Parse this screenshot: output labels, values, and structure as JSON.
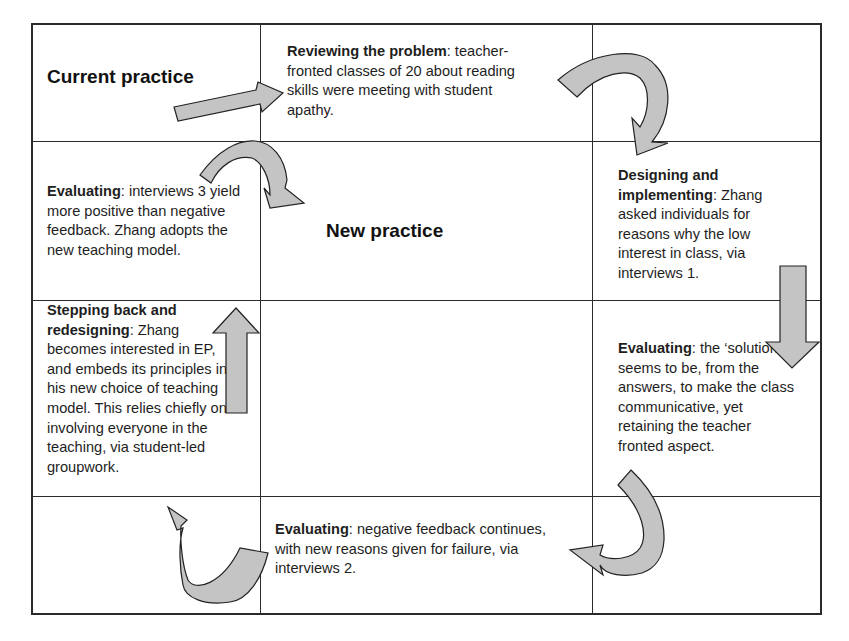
{
  "diagram": {
    "title_current": "Current practice",
    "title_new": "New practice",
    "cells": {
      "reviewing": {
        "heading": "Reviewing the problem",
        "body": ": teacher-fronted classes of 20 about reading skills were meeting with student apathy."
      },
      "designing": {
        "heading": "Designing and implementing",
        "body": ": Zhang asked individuals for reasons why the low interest in class, via interviews 1."
      },
      "evaluating_solution": {
        "heading": "Evaluating",
        "body": ": the ‘solution’ seems to be, from the answers, to make the class communicative, yet retaining the teacher fronted aspect."
      },
      "evaluating_negative": {
        "heading": "Evaluating",
        "body": ": negative feedback continues, with new reasons given for failure, via interviews 2."
      },
      "stepping_back": {
        "heading": "Stepping back and redesigning",
        "body": ": Zhang becomes interested in EP, and embeds its principles in his new choice of teaching model. This relies chiefly on involving everyone in the teaching, via student-led groupwork."
      },
      "evaluating_positive": {
        "heading": "Evaluating",
        "body": ": interviews 3 yield more positive than negative feedback. Zhang adopts the new teaching model."
      }
    },
    "colors": {
      "arrow_fill": "#c4c4c4",
      "arrow_stroke": "#222222",
      "grid": "#2a2a2a"
    },
    "flow": [
      "Current practice",
      "Reviewing the problem",
      "Designing and implementing",
      "Evaluating (solution)",
      "Evaluating (negative feedback)",
      "Stepping back and redesigning",
      "Evaluating (positive feedback)",
      "New practice"
    ]
  }
}
